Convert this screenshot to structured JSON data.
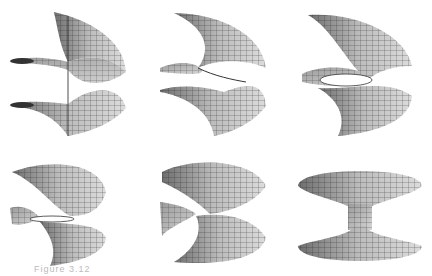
{
  "figure": {
    "panels": [
      {
        "id": 1,
        "label": "helicoid",
        "row": 1,
        "col": 1
      },
      {
        "id": 2,
        "label": "intermediate surface 1",
        "row": 1,
        "col": 2
      },
      {
        "id": 3,
        "label": "intermediate surface 2",
        "row": 1,
        "col": 3
      },
      {
        "id": 4,
        "label": "intermediate surface 3",
        "row": 2,
        "col": 1
      },
      {
        "id": 5,
        "label": "intermediate surface 4",
        "row": 2,
        "col": 2
      },
      {
        "id": 6,
        "label": "catenoid",
        "row": 2,
        "col": 3
      }
    ],
    "caption": "Figure 3.12",
    "colors": {
      "surface_light": "#d8d8d8",
      "surface_dark": "#8a8a8a",
      "mesh": "#222222",
      "background": "#ffffff"
    }
  }
}
